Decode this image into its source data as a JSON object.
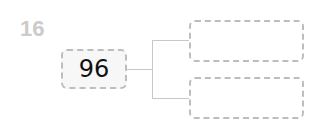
{
  "problem": {
    "number": "16",
    "root_value": "96",
    "branches": [
      {
        "value": ""
      },
      {
        "value": ""
      }
    ]
  },
  "colors": {
    "number": "#cbcbcb",
    "border": "#bdbdbd",
    "connector": "#c8c8c8"
  }
}
